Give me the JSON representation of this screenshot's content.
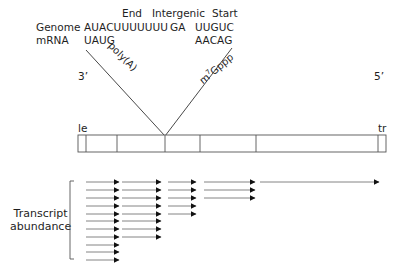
{
  "header": {
    "end_label": "End",
    "intergenic_label": "Intergenic",
    "start_label": "Start",
    "genome_label": "Genome",
    "mrna_label": "mRNA",
    "genome_end_seq": "AUACUUUUUUU",
    "genome_intergenic_seq": "GA",
    "genome_start_seq": "UUGUC",
    "mrna_end_seq": "UAUG",
    "mrna_polyA": "poly(A)",
    "mrna_start_seq": "AACAG",
    "mrna_cap": "m⁷Gppp"
  },
  "genome": {
    "three_prime": "3’",
    "five_prime": "5’",
    "leader": "le",
    "trailer": "tr",
    "genes": [
      {
        "label": "N"
      },
      {
        "label": "P"
      },
      {
        "label": "M"
      },
      {
        "label": "G"
      },
      {
        "label": "L"
      }
    ]
  },
  "transcripts": {
    "axis_label_line1": "Transcript",
    "axis_label_line2": "abundance",
    "counts_per_gene": {
      "N": 11,
      "P": 8,
      "M": 5,
      "G": 3,
      "L": 1
    }
  },
  "colors": {
    "line": "#333333",
    "box_line": "#555555",
    "text": "#1e1e1e"
  }
}
